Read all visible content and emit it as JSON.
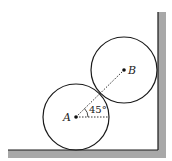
{
  "diagram": {
    "type": "two cylinders resting in a corner between floor and wall",
    "labels": {
      "point_a": "A",
      "point_b": "B",
      "angle": "45°"
    },
    "colors": {
      "stroke": "#1a1a1a",
      "wall_fill": "#a8a8a8",
      "background": "#ffffff"
    },
    "elements": {
      "circle_a": {
        "cx": 76,
        "cy": 118,
        "r": 33
      },
      "circle_b": {
        "cx": 124,
        "cy": 71,
        "r": 33
      },
      "line_ab_angle_deg": 45
    }
  }
}
